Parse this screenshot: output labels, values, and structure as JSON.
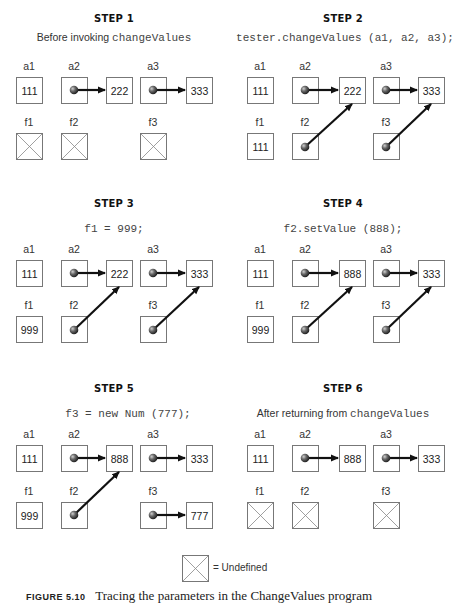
{
  "steps": [
    {
      "title": "STEP 1",
      "subtitle_text": "Before invoking ",
      "subtitle_code": "changeValues",
      "labels": {
        "a1": "a1",
        "a2": "a2",
        "a3": "a3",
        "f1": "f1",
        "f2": "f2",
        "f3": "f3"
      },
      "a1_value": "111",
      "a2_target": "222",
      "a3_target": "333",
      "f1": "undefined",
      "f2": "undefined",
      "f3": "undefined"
    },
    {
      "title": "STEP 2",
      "subtitle_code": "tester.changeValues (a1, a2, a3);",
      "labels": {
        "a1": "a1",
        "a2": "a2",
        "a3": "a3",
        "f1": "f1",
        "f2": "f2",
        "f3": "f3"
      },
      "a1_value": "111",
      "a2_target": "222",
      "a3_target": "333",
      "f1_value": "111",
      "f2": "points to a2 target",
      "f3": "points to a3 target"
    },
    {
      "title": "STEP 3",
      "subtitle_code": "f1 = 999;",
      "labels": {
        "a1": "a1",
        "a2": "a2",
        "a3": "a3",
        "f1": "f1",
        "f2": "f2",
        "f3": "f3"
      },
      "a1_value": "111",
      "a2_target": "222",
      "a3_target": "333",
      "f1_value": "999",
      "f2": "points to a2 target",
      "f3": "points to a3 target"
    },
    {
      "title": "STEP 4",
      "subtitle_code": "f2.setValue (888);",
      "labels": {
        "a1": "a1",
        "a2": "a2",
        "a3": "a3",
        "f1": "f1",
        "f2": "f2",
        "f3": "f3"
      },
      "a1_value": "111",
      "a2_target": "888",
      "a3_target": "333",
      "f1_value": "999",
      "f2": "points to a2 target",
      "f3": "points to a3 target"
    },
    {
      "title": "STEP 5",
      "subtitle_code": "f3 = new Num (777);",
      "labels": {
        "a1": "a1",
        "a2": "a2",
        "a3": "a3",
        "f1": "f1",
        "f2": "f2",
        "f3": "f3"
      },
      "a1_value": "111",
      "a2_target": "888",
      "a3_target": "333",
      "f1_value": "999",
      "f2": "points to a2 target",
      "f3_target": "777"
    },
    {
      "title": "STEP 6",
      "subtitle_text": "After returning from ",
      "subtitle_code": "changeValues",
      "labels": {
        "a1": "a1",
        "a2": "a2",
        "a3": "a3",
        "f1": "f1",
        "f2": "f2",
        "f3": "f3"
      },
      "a1_value": "111",
      "a2_target": "888",
      "a3_target": "333",
      "f1": "undefined",
      "f2": "undefined",
      "f3": "undefined"
    }
  ],
  "legend": {
    "text": "= Undefined"
  },
  "caption": {
    "label": "FIGURE 5.10",
    "text": "Tracing the parameters in the ChangeValues program"
  }
}
